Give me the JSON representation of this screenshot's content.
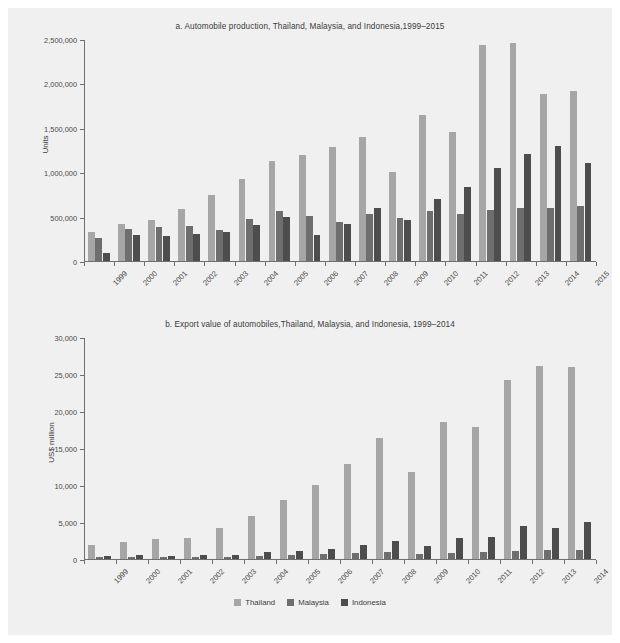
{
  "figure": {
    "background": "#f0f0f0",
    "legend": {
      "position": "bottom-center",
      "entries": [
        {
          "label": "Thailand",
          "color": "#a6a6a6"
        },
        {
          "label": "Malaysia",
          "color": "#6e6e6e"
        },
        {
          "label": "Indonesia",
          "color": "#4d4d4d"
        }
      ]
    }
  },
  "chart_data": [
    {
      "id": "a",
      "type": "bar",
      "title": "a. Automobile production, Thailand, Malaysia, and Indonesia,1999–2015",
      "xlabel": "",
      "ylabel": "Units",
      "ylim": [
        0,
        2500000
      ],
      "yticks": [
        0,
        500000,
        1000000,
        1500000,
        2000000,
        2500000
      ],
      "ytick_labels": [
        "0",
        "500,000",
        "1,000,000",
        "1,500,000",
        "2,000,000",
        "2,500,000"
      ],
      "grid": false,
      "legend_position": "bottom-center",
      "categories": [
        "1999",
        "2000",
        "2001",
        "2002",
        "2003",
        "2004",
        "2005",
        "2006",
        "2007",
        "2008",
        "2009",
        "2010",
        "2011",
        "2012",
        "2013",
        "2014",
        "2015"
      ],
      "series": [
        {
          "name": "Thailand",
          "color": "#a6a6a6",
          "values": [
            322000,
            412000,
            459000,
            584000,
            742000,
            928000,
            1122000,
            1194000,
            1287000,
            1394000,
            999000,
            1645000,
            1458000,
            2429000,
            2457000,
            1880000,
            1915000
          ]
        },
        {
          "name": "Malaysia",
          "color": "#6e6e6e",
          "values": [
            254000,
            360000,
            380000,
            395000,
            345000,
            472000,
            563000,
            502000,
            442000,
            530000,
            489000,
            567000,
            534000,
            570000,
            601000,
            596000,
            615000
          ]
        },
        {
          "name": "Indonesia",
          "color": "#4d4d4d",
          "values": [
            88000,
            293000,
            279000,
            299000,
            322000,
            408000,
            500000,
            296000,
            412000,
            601000,
            465000,
            703000,
            838000,
            1053000,
            1208000,
            1298000,
            1099000
          ]
        }
      ]
    },
    {
      "id": "b",
      "type": "bar",
      "title": "b. Export value of automobiles,Thailand, Malaysia, and Indonesia, 1999–2014",
      "xlabel": "",
      "ylabel": "US$ million",
      "ylim": [
        0,
        30000
      ],
      "yticks": [
        0,
        5000,
        10000,
        15000,
        20000,
        25000,
        30000
      ],
      "ytick_labels": [
        "0",
        "5,000",
        "10,000",
        "15,000",
        "20,000",
        "25,000",
        "30,000"
      ],
      "grid": false,
      "legend_position": "bottom-center",
      "categories": [
        "1999",
        "2000",
        "2001",
        "2002",
        "2003",
        "2004",
        "2005",
        "2006",
        "2007",
        "2008",
        "2009",
        "2010",
        "2011",
        "2012",
        "2013",
        "2014"
      ],
      "series": [
        {
          "name": "Thailand",
          "color": "#a6a6a6",
          "values": [
            1950,
            2250,
            2700,
            2900,
            4150,
            5750,
            7950,
            9950,
            12850,
            16350,
            11800,
            18450,
            17900,
            24200,
            26050,
            25900
          ]
        },
        {
          "name": "Malaysia",
          "color": "#6e6e6e",
          "values": [
            230,
            260,
            230,
            280,
            330,
            460,
            600,
            650,
            750,
            900,
            700,
            850,
            900,
            1150,
            1250,
            1200
          ]
        },
        {
          "name": "Indonesia",
          "color": "#4d4d4d",
          "values": [
            420,
            480,
            440,
            500,
            560,
            900,
            1150,
            1400,
            1950,
            2500,
            1700,
            2800,
            3000,
            4500,
            4150,
            5000
          ]
        }
      ]
    }
  ]
}
